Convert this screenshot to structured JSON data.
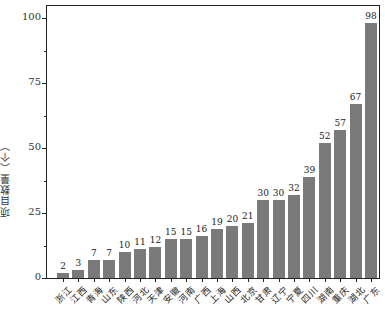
{
  "chart_data": {
    "type": "bar",
    "title": "",
    "xlabel": "",
    "ylabel": "项目数量（个）",
    "ylim": [
      0,
      105
    ],
    "yticks": [
      0,
      25,
      50,
      75,
      100
    ],
    "grid": false,
    "legend": null,
    "bar_color": "#7a7a7a",
    "categories": [
      "浙江",
      "江西",
      "青海",
      "山东",
      "陕西",
      "河北",
      "天津",
      "安徽",
      "河南",
      "广西",
      "上海",
      "山西",
      "北京",
      "甘肃",
      "辽宁",
      "宁夏",
      "四川",
      "湖南",
      "重庆",
      "湖北",
      "广东"
    ],
    "values": [
      2,
      3,
      7,
      7,
      10,
      11,
      12,
      15,
      15,
      16,
      19,
      20,
      21,
      30,
      30,
      32,
      39,
      52,
      57,
      67,
      98
    ],
    "data_labels": true
  }
}
